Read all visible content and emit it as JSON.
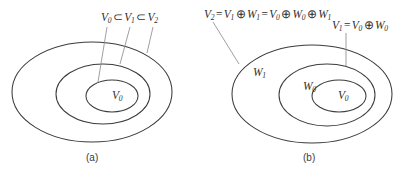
{
  "figure": {
    "background_color": "#ffffff",
    "stroke_color": "#3c3c3c",
    "leader_color": "#8e8e93",
    "text_color": "#2f2f2f"
  },
  "panel_a": {
    "caption": "(a)",
    "chain_formula": {
      "v0": "V",
      "v0_sub": "0",
      "subset1": "⊂",
      "v1": "V",
      "v1_sub": "1",
      "subset2": "⊂",
      "v2": "V",
      "v2_sub": "2"
    },
    "inner_label": {
      "symbol": "V",
      "sub": "0"
    },
    "sets": [
      {
        "name": "V2",
        "role": "outer-ellipse"
      },
      {
        "name": "V1",
        "role": "middle-ellipse"
      },
      {
        "name": "V0",
        "role": "inner-ellipse"
      }
    ]
  },
  "panel_b": {
    "caption": "(b)",
    "top_formula": {
      "lhs": "V",
      "lhs_sub": "2",
      "eq1": "=",
      "t1": "V",
      "t1_sub": "1",
      "oplus1": "⊕",
      "t2": "W",
      "t2_sub": "1",
      "eq2": "=",
      "t3": "V",
      "t3_sub": "0",
      "oplus2": "⊕",
      "t4": "W",
      "t4_sub": "0",
      "oplus3": "⊕",
      "t5": "W",
      "t5_sub": "1"
    },
    "right_formula": {
      "lhs": "V",
      "lhs_sub": "1",
      "eq": "=",
      "t1": "V",
      "t1_sub": "0",
      "oplus": "⊕",
      "t2": "W",
      "t2_sub": "0"
    },
    "region_labels": [
      {
        "symbol": "W",
        "sub": "1",
        "role": "outer-annulus"
      },
      {
        "symbol": "W",
        "sub": "0",
        "role": "middle-annulus"
      },
      {
        "symbol": "V",
        "sub": "0",
        "role": "inner-ellipse"
      }
    ]
  }
}
